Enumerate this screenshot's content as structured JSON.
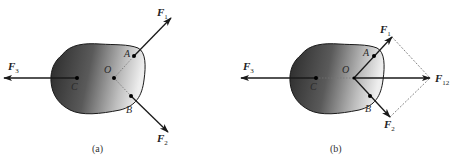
{
  "figure": {
    "panels": [
      {
        "id": "a",
        "caption": "(a)",
        "points": {
          "C": "C",
          "O": "O",
          "A": "A",
          "B": "B"
        },
        "forces": [
          {
            "name": "F",
            "sub": "1",
            "applied_at": "A"
          },
          {
            "name": "F",
            "sub": "2",
            "applied_at": "B"
          },
          {
            "name": "F",
            "sub": "3",
            "applied_at": "C"
          }
        ]
      },
      {
        "id": "b",
        "caption": "(b)",
        "points": {
          "C": "C",
          "O": "O",
          "A": "A",
          "B": "B"
        },
        "forces": [
          {
            "name": "F",
            "sub": "1",
            "applied_at": "O"
          },
          {
            "name": "F",
            "sub": "2",
            "applied_at": "O"
          },
          {
            "name": "F",
            "sub": "3",
            "applied_at": "C"
          },
          {
            "name": "F",
            "sub": "12",
            "applied_at": "O",
            "note": "resultant of F1 and F2 (parallelogram)"
          }
        ]
      }
    ],
    "colors": {
      "body_dark": "#2e2e2e",
      "body_light": "#e6e6e6",
      "arrow": "#1a1a1a",
      "dashed": "#555555"
    }
  }
}
